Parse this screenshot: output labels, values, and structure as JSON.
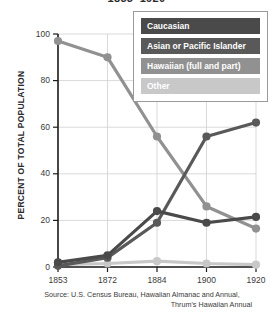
{
  "title": "1853–1920",
  "axes": {
    "y_title": "PERCENT OF TOTAL POPULATION",
    "y_ticks": [
      "0",
      "20",
      "40",
      "60",
      "80",
      "100"
    ],
    "x_ticks": [
      "1853",
      "1872",
      "1884",
      "1900",
      "1920"
    ]
  },
  "legend": {
    "items": [
      {
        "label": "Caucasian",
        "color": "#4a4a4a"
      },
      {
        "label": "Asian or Pacific Islander",
        "color": "#595959"
      },
      {
        "label": "Hawaiian (full and part)",
        "color": "#919191"
      },
      {
        "label": "Other",
        "color": "#c8c8c8"
      }
    ]
  },
  "source": {
    "line1": "Source: U.S. Census Bureau, Hawaiian Almanac and Annual,",
    "line2": "Thrum's Hawaiian Annual"
  },
  "chart_data": {
    "type": "line",
    "title": "1853–1920",
    "xlabel": "",
    "ylabel": "PERCENT OF TOTAL POPULATION",
    "categories": [
      "1853",
      "1872",
      "1884",
      "1900",
      "1920"
    ],
    "x": [
      1853,
      1872,
      1884,
      1900,
      1920
    ],
    "ylim": [
      0,
      100
    ],
    "yticks": [
      0,
      20,
      40,
      60,
      80,
      100
    ],
    "grid": true,
    "legend_position": "top-right",
    "series": [
      {
        "name": "Caucasian",
        "color": "#4a4a4a",
        "values": [
          2,
          5,
          24,
          19,
          21.5
        ]
      },
      {
        "name": "Asian or Pacific Islander",
        "color": "#595959",
        "values": [
          0.5,
          4,
          19,
          56,
          62
        ]
      },
      {
        "name": "Hawaiian (full and part)",
        "color": "#919191",
        "values": [
          97,
          90,
          56,
          26,
          16.5
        ]
      },
      {
        "name": "Other",
        "color": "#c8c8c8",
        "values": [
          1,
          1.5,
          2.5,
          1.5,
          1
        ]
      }
    ]
  }
}
